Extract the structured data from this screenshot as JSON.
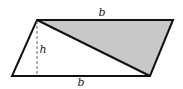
{
  "diagram": {
    "type": "parallelogram-area",
    "vertices": {
      "top_left": [
        37,
        20
      ],
      "top_right": [
        173,
        20
      ],
      "bottom_right": [
        150,
        76
      ],
      "bottom_left": [
        12,
        76
      ]
    },
    "shaded_triangle": "top_left-top_right-bottom_right",
    "shade_color": "#c8c8c8",
    "stroke_color": "#111111",
    "labels": {
      "top_base": "b",
      "bottom_base": "b",
      "height": "h"
    }
  }
}
